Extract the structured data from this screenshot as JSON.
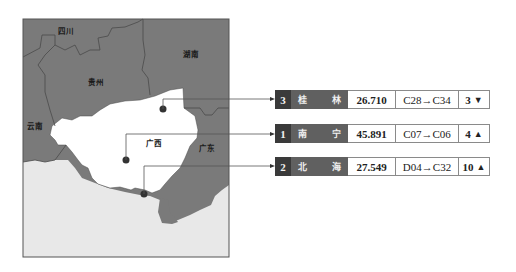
{
  "map": {
    "colors": {
      "neighbor": "#7a7a7a",
      "guangxi": "#ffffff",
      "sea": "#e8e8e8",
      "border": "#4a4a4a",
      "frame": "#555555"
    },
    "regions": [
      {
        "name": "四川",
        "x": 58,
        "y": 26
      },
      {
        "name": "湖南",
        "x": 183,
        "y": 49
      },
      {
        "name": "贵州",
        "x": 88,
        "y": 77
      },
      {
        "name": "云南",
        "x": 27,
        "y": 121
      },
      {
        "name": "广西",
        "x": 146,
        "y": 138
      },
      {
        "name": "广东",
        "x": 199,
        "y": 143
      }
    ]
  },
  "cities": [
    {
      "rank": "3",
      "name_a": "桂",
      "name_b": "林",
      "value": "26.710",
      "code": "C28→C34",
      "change": "3",
      "direction": "down",
      "arrow": "🡇"
    },
    {
      "rank": "1",
      "name_a": "南",
      "name_b": "宁",
      "value": "45.891",
      "code": "C07→C06",
      "change": "4",
      "direction": "up",
      "arrow": "🡅"
    },
    {
      "rank": "2",
      "name_a": "北",
      "name_b": "海",
      "value": "27.549",
      "code": "D04→C32",
      "change": "10",
      "direction": "up",
      "arrow": "🡅"
    }
  ]
}
